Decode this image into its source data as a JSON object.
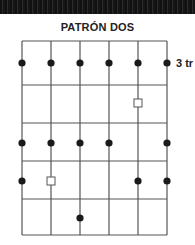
{
  "title": "PATRÓN DOS",
  "side_label": "3 tr",
  "colors": {
    "line": "#555555",
    "dot": "#1a1a1a",
    "square_stroke": "#555555",
    "background": "#ffffff"
  },
  "grid": {
    "columns_x": [
      22,
      51,
      80,
      109,
      138,
      167
    ],
    "rows_y": [
      41,
      85,
      123,
      161,
      199,
      235
    ]
  },
  "dots": [
    {
      "x": 22,
      "y": 63
    },
    {
      "x": 51,
      "y": 63
    },
    {
      "x": 80,
      "y": 63
    },
    {
      "x": 109,
      "y": 63
    },
    {
      "x": 138,
      "y": 63
    },
    {
      "x": 167,
      "y": 63
    },
    {
      "x": 22,
      "y": 143
    },
    {
      "x": 51,
      "y": 143
    },
    {
      "x": 80,
      "y": 143
    },
    {
      "x": 109,
      "y": 143
    },
    {
      "x": 167,
      "y": 143
    },
    {
      "x": 22,
      "y": 181
    },
    {
      "x": 138,
      "y": 181
    },
    {
      "x": 167,
      "y": 181
    },
    {
      "x": 80,
      "y": 218
    }
  ],
  "squares": [
    {
      "x": 138,
      "y": 103
    },
    {
      "x": 51,
      "y": 181
    }
  ]
}
